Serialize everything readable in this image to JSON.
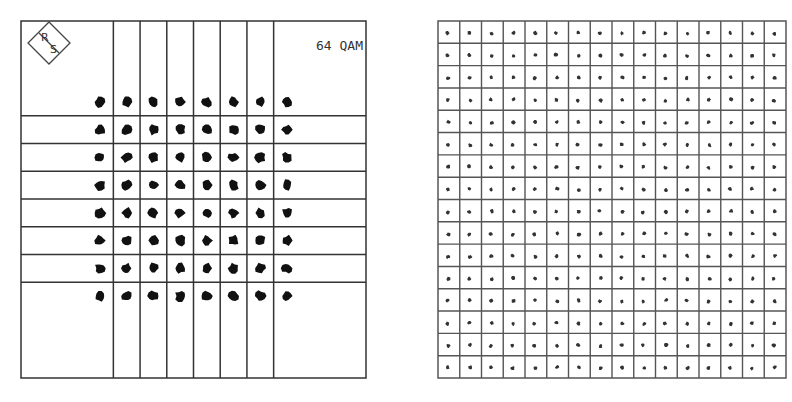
{
  "chart_data": [
    {
      "type": "scatter",
      "name": "constellation-64qam",
      "title": "64 QAM",
      "logo_text": [
        "R",
        "S"
      ],
      "grid": true,
      "points_per_axis": 8,
      "i_levels": [
        -7,
        -5,
        -3,
        -1,
        1,
        3,
        5,
        7
      ],
      "q_levels": [
        7,
        5,
        3,
        1,
        -1,
        -3,
        -5,
        -7
      ],
      "decision_boundaries": [
        -6,
        -4,
        -2,
        0,
        2,
        4,
        6
      ],
      "axis_range": [
        -10,
        10
      ],
      "point_color": "#111111",
      "line_color": "#333333"
    },
    {
      "type": "scatter",
      "name": "constellation-256qam",
      "title": "",
      "grid": true,
      "points_per_axis": 16,
      "i_levels": [
        -15,
        -13,
        -11,
        -9,
        -7,
        -5,
        -3,
        -1,
        1,
        3,
        5,
        7,
        9,
        11,
        13,
        15
      ],
      "q_levels": [
        15,
        13,
        11,
        9,
        7,
        5,
        3,
        1,
        -1,
        -3,
        -5,
        -7,
        -9,
        -11,
        -13,
        -15
      ],
      "axis_range": [
        -16,
        16
      ],
      "point_color": "#333333",
      "line_color": "#555555"
    }
  ]
}
